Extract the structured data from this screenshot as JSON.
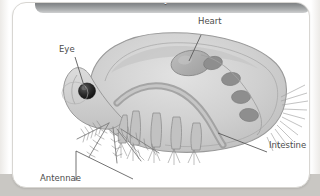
{
  "window": {
    "header_title": "Daphnia"
  },
  "figure": {
    "alt_name": "daphnia-anatomy-illustration",
    "labels": [
      {
        "id": "heart",
        "text": "Heart"
      },
      {
        "id": "eye",
        "text": "Eye"
      },
      {
        "id": "intestine",
        "text": "Intestine"
      },
      {
        "id": "antennae",
        "text": "Antennae"
      }
    ],
    "colors": {
      "header_dark": "#55585a",
      "header_light": "#cfd0d1",
      "card_background": "#ffffff",
      "card_border": "#d8d6d2",
      "backdrop_grey": "#c9c7c3",
      "body_fill": "#d2d2d2",
      "body_outline": "#9a9a9a",
      "organ_fill": "#b0b0b0",
      "egg_fill": "#8e8e8e",
      "eye_fill": "#2b2b2b",
      "leader_line": "#5a5a5a",
      "label_text": "#4c4c4c"
    }
  }
}
